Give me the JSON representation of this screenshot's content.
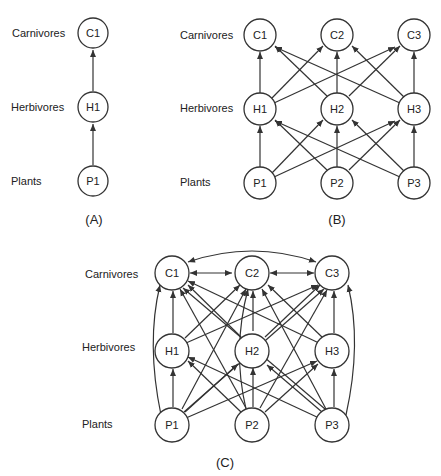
{
  "levels": [
    "Carnivores",
    "Herbivores",
    "Plants"
  ],
  "panels": [
    {
      "id": "A",
      "caption": "(A)",
      "nodes": [
        "C1",
        "H1",
        "P1"
      ]
    },
    {
      "id": "B",
      "caption": "(B)",
      "nodes": [
        "C1",
        "C2",
        "C3",
        "H1",
        "H2",
        "H3",
        "P1",
        "P2",
        "P3"
      ]
    },
    {
      "id": "C",
      "caption": "(C)",
      "nodes": [
        "C1",
        "C2",
        "C3",
        "H1",
        "H2",
        "H3",
        "P1",
        "P2",
        "P3"
      ]
    }
  ],
  "edges": {
    "A": [
      [
        "P1",
        "H1"
      ],
      [
        "H1",
        "C1"
      ]
    ],
    "B": [
      [
        "P1",
        "H1"
      ],
      [
        "P1",
        "H2"
      ],
      [
        "P1",
        "H3"
      ],
      [
        "P2",
        "H1"
      ],
      [
        "P2",
        "H2"
      ],
      [
        "P2",
        "H3"
      ],
      [
        "P3",
        "H1"
      ],
      [
        "P3",
        "H2"
      ],
      [
        "P3",
        "H3"
      ],
      [
        "H1",
        "C1"
      ],
      [
        "H1",
        "C2"
      ],
      [
        "H1",
        "C3"
      ],
      [
        "H2",
        "C1"
      ],
      [
        "H2",
        "C2"
      ],
      [
        "H2",
        "C3"
      ],
      [
        "H3",
        "C1"
      ],
      [
        "H3",
        "C2"
      ],
      [
        "H3",
        "C3"
      ]
    ],
    "C": "all herbivore-carnivore, plant-herbivore, plant-carnivore links plus C1<->C2, C2<->C3, C1<->C3"
  }
}
